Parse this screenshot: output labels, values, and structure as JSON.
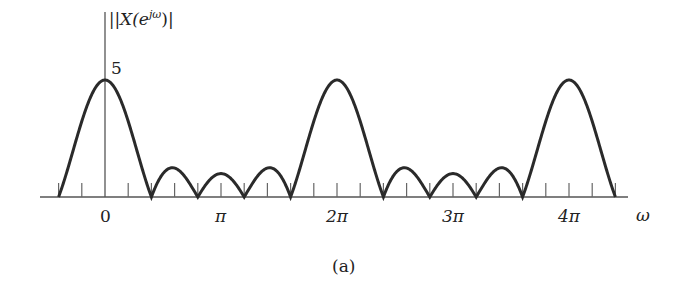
{
  "chart_data": {
    "type": "line",
    "title": "",
    "ylabel": "|X(e^{jω})|",
    "xlabel": "ω",
    "caption": "(a)",
    "y_tick_label": "5",
    "x_tick_labels": [
      "0",
      "π",
      "2π",
      "3π",
      "4π"
    ],
    "x_tick_positions_rad": [
      0,
      3.1416,
      6.2832,
      9.4248,
      12.5664
    ],
    "minor_tick_spacing": "π/5",
    "xlim_rad": [
      -1.26,
      14.2
    ],
    "ylim": [
      0,
      5
    ],
    "function": "|sin(5ω/2) / sin(ω/2)|",
    "peak_value": 5,
    "peaks_at": [
      "0",
      "2π",
      "4π"
    ],
    "zero_crossings_per_period": [
      "2π/5",
      "4π/5",
      "6π/5",
      "8π/5"
    ],
    "series": [
      {
        "name": "|X(e^{jω})|",
        "x_label": "ω (rad)",
        "x": [
          -1.2566,
          -0.6283,
          0,
          0.6283,
          1.2566,
          1.885,
          2.5133,
          3.1416,
          3.7699,
          4.3982,
          5.0265,
          5.6549,
          6.2832,
          6.9115,
          7.5398,
          8.1681,
          8.7965,
          9.4248,
          10.0531,
          10.6814,
          11.3097,
          11.9381,
          12.5664,
          13.1947,
          13.823
        ],
        "values": [
          0,
          3.24,
          5,
          3.24,
          0,
          1.24,
          0,
          1,
          0,
          1.24,
          0,
          3.24,
          5,
          3.24,
          0,
          1.24,
          0,
          1,
          0,
          1.24,
          0,
          3.24,
          5,
          3.24,
          0
        ]
      }
    ],
    "grid": false,
    "legend": null
  },
  "labels": {
    "ylabel": "|X(e",
    "ylabel_sup": "jω",
    "ylabel_end": ")|",
    "y5": "5",
    "x0": "0",
    "xpi": "π",
    "x2pi": "2π",
    "x3pi": "3π",
    "x4pi": "4π",
    "omega": "ω",
    "caption": "(a)"
  }
}
